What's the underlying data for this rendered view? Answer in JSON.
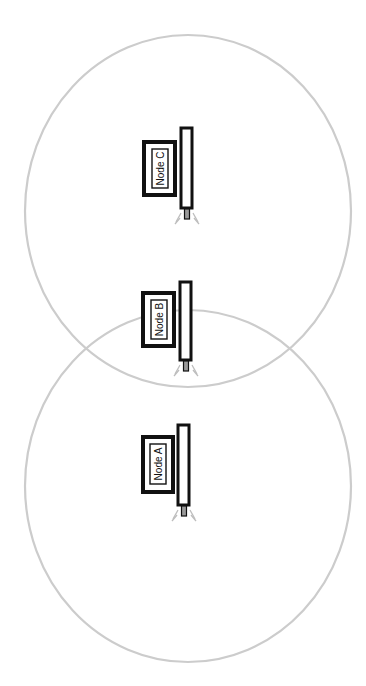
{
  "diagram": {
    "colors": {
      "range_stroke": "#cccccc",
      "node_stroke": "#111111",
      "connector_fill": "#9a9a9a",
      "signal_stroke": "#bdbdbd",
      "background": "#ffffff"
    },
    "ranges": [
      {
        "name": "range-upper",
        "cx": 188,
        "cy": 211,
        "rx": 163,
        "ry": 176
      },
      {
        "name": "range-lower",
        "cx": 188,
        "cy": 486,
        "rx": 163,
        "ry": 176
      }
    ],
    "nodes": [
      {
        "id": "C",
        "label": "Node C"
      },
      {
        "id": "B",
        "label": "Node B"
      },
      {
        "id": "A",
        "label": "Node A"
      }
    ]
  }
}
